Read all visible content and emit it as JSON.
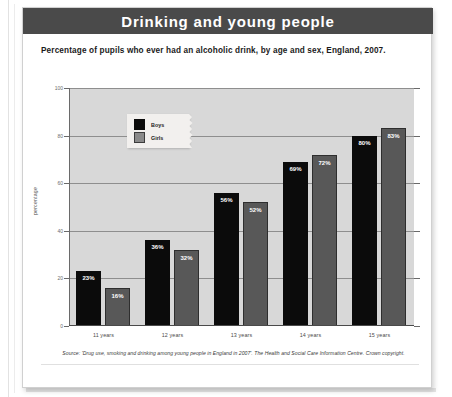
{
  "page": {
    "title": "Drinking and young people"
  },
  "chart_data": {
    "type": "bar",
    "title": "Drinking and young people",
    "subtitle": "Percentage of pupils who ever had an alcoholic drink, by age and sex, England, 2007.",
    "xlabel": "",
    "ylabel": "percentage",
    "categories": [
      "11 years",
      "12 years",
      "13 years",
      "14 years",
      "15 years"
    ],
    "series": [
      {
        "name": "Boys",
        "color": "#0b0b0b",
        "values": [
          23,
          36,
          56,
          69,
          80
        ],
        "labels": [
          "23%",
          "36%",
          "56%",
          "69%",
          "80%"
        ]
      },
      {
        "name": "Girls",
        "color": "#585858",
        "values": [
          16,
          32,
          52,
          72,
          83
        ],
        "labels": [
          "16%",
          "32%",
          "52%",
          "72%",
          "83%"
        ]
      }
    ],
    "ylim": [
      0,
      100
    ],
    "yticks": [
      "0",
      "20",
      "40",
      "60",
      "80",
      "100"
    ],
    "grid": true,
    "legend_position": "top-left",
    "plot_background": "#d8d8d8",
    "source": "Source: 'Drug use, smoking and drinking among young people in England in 2007'. The Health and Social Care Information Centre. Crown copyright."
  }
}
